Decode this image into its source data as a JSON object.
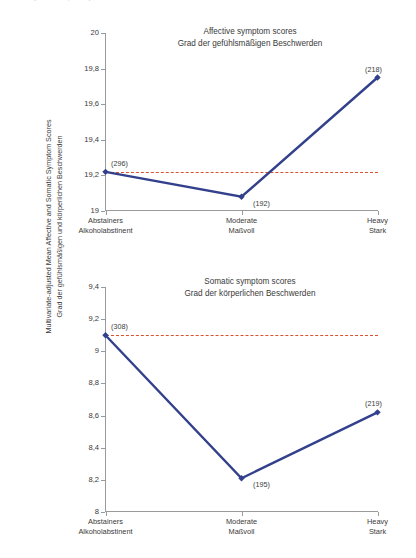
{
  "top_fragment": "(nach Noll, 1994)",
  "y_axis_title": {
    "line_en": "Multivariate-adjusted Mean Affective and Somatic Symptom Scores",
    "line_de": "Grad der gefühlsmäßigen und körperlichen Beschwerden"
  },
  "chart_data": [
    {
      "type": "line",
      "id": "affective",
      "title": "Affective symptom scores",
      "subtitle": "Grad der gefühlsmäßigen Beschwerden",
      "xlabel": "",
      "ylabel": "Multivariate-adjusted Mean Affective and Somatic Symptom Scores",
      "categories": [
        "Abstainers",
        "Moderate",
        "Heavy"
      ],
      "categories_de": [
        "Alkoholabstinent",
        "Maßvoll",
        "Stark"
      ],
      "values": [
        19.22,
        19.08,
        19.75
      ],
      "point_labels": [
        "(296)",
        "(192)",
        "(218)"
      ],
      "ylim": [
        19,
        20
      ],
      "yticks": [
        19,
        19.2,
        19.4,
        19.6,
        19.8,
        20
      ],
      "ytick_labels": [
        "19",
        "19,2",
        "19,4",
        "19,6",
        "19,8",
        "20"
      ],
      "reference_line": 19.22,
      "grid": false,
      "legend": "none",
      "line_color": "#33408c",
      "marker_color": "#33408c",
      "reference_color": "#d8532c"
    },
    {
      "type": "line",
      "id": "somatic",
      "title": "Somatic symptom scores",
      "subtitle": "Grad der körperlichen Beschwerden",
      "xlabel": "",
      "ylabel": "Multivariate-adjusted Mean Affective and Somatic Symptom Scores",
      "categories": [
        "Abstainers",
        "Moderate",
        "Heavy"
      ],
      "categories_de": [
        "Alkoholabstinent",
        "Maßvoll",
        "Stark"
      ],
      "values": [
        9.1,
        8.21,
        8.62
      ],
      "point_labels": [
        "(308)",
        "(195)",
        "(219)"
      ],
      "ylim": [
        8,
        9.4
      ],
      "yticks": [
        8,
        8.2,
        8.4,
        8.6,
        8.8,
        9,
        9.2,
        9.4
      ],
      "ytick_labels": [
        "8",
        "8,2",
        "8,4",
        "8,6",
        "8,8",
        "9",
        "9,2",
        "9,4"
      ],
      "reference_line": 9.1,
      "grid": false,
      "legend": "none",
      "line_color": "#33408c",
      "marker_color": "#33408c",
      "reference_color": "#d8532c"
    }
  ]
}
